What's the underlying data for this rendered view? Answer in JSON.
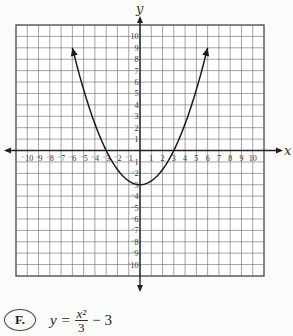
{
  "chart_data": {
    "type": "line",
    "title": "",
    "xlabel": "x",
    "ylabel": "y",
    "xlim": [
      -11,
      11
    ],
    "ylim": [
      -11,
      11
    ],
    "grid": true,
    "x_ticks": [
      -10,
      -9,
      -8,
      -7,
      -6,
      -5,
      -4,
      -3,
      -2,
      -1,
      1,
      2,
      3,
      4,
      5,
      6,
      7,
      8,
      9,
      10
    ],
    "y_ticks": [
      10,
      9,
      8,
      7,
      6,
      5,
      4,
      3,
      2,
      1,
      -1,
      -2,
      -3,
      -4,
      -5,
      -6,
      -7,
      -8,
      -9,
      -10
    ],
    "series": [
      {
        "name": "y = x^2/3 - 3",
        "function": "x^2/3 - 3",
        "x_range": [
          -6,
          6
        ],
        "vertex": [
          0,
          -3
        ],
        "x_intercepts": [
          -3,
          3
        ],
        "arrows_at_ends": true
      }
    ]
  },
  "answer": {
    "choice_label": "F.",
    "equation_lhs": "y =",
    "numerator": "x²",
    "denominator": "3",
    "equation_rest": "− 3"
  }
}
